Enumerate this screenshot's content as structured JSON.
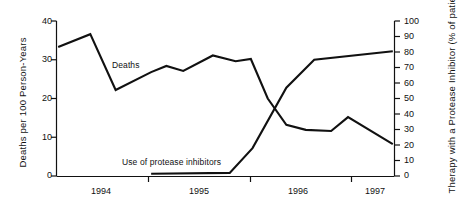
{
  "chart_data": {
    "type": "line",
    "title": "",
    "xlabel": "",
    "ylabel": "Deaths per 100 Person-Years",
    "y2label": "Therapy with a Protease Inhibitor (% of patient-days)",
    "grid": false,
    "legend_position": "inline-annotations",
    "xlim": [
      1993.5,
      1997.5
    ],
    "ylim": [
      0,
      40
    ],
    "y2lim": [
      0,
      100
    ],
    "xticks": [
      1994.0,
      1995.0,
      1996.0,
      1997.0
    ],
    "xtick_labels": [
      "1994",
      "1995",
      "1996",
      "1997"
    ],
    "xtick_label_positions": [
      1993.75,
      1994.75,
      1995.7,
      1996.45
    ],
    "yticks": [
      0,
      10,
      20,
      30,
      40
    ],
    "ytick_labels": [
      "0",
      "10",
      "20",
      "30",
      "40"
    ],
    "y2ticks": [
      0,
      10,
      20,
      30,
      40,
      50,
      60,
      70,
      80,
      90,
      100
    ],
    "y2tick_labels": [
      "0",
      "10",
      "20",
      "30",
      "40",
      "50",
      "60",
      "70",
      "80",
      "90",
      "100"
    ],
    "series": [
      {
        "name": "Deaths",
        "axis": "left",
        "annotation": "Deaths",
        "x": [
          1993.52,
          1993.9,
          1994.2,
          1994.62,
          1994.8,
          1995.0,
          1995.35,
          1995.62,
          1995.8,
          1996.0,
          1996.22,
          1996.45,
          1996.75,
          1996.95,
          1997.48
        ],
        "values": [
          33.3,
          36.6,
          22.2,
          26.8,
          28.4,
          27.1,
          31.1,
          29.6,
          30.2,
          20.0,
          13.2,
          11.9,
          11.6,
          15.2,
          8.2
        ]
      },
      {
        "name": "Use of protease inhibitors",
        "axis": "right",
        "annotation": "Use of protease inhibitors",
        "x": [
          1994.62,
          1995.55,
          1995.82,
          1996.22,
          1996.55,
          1997.48
        ],
        "values": [
          1.5,
          2.0,
          18.0,
          57.0,
          75.0,
          80.5
        ]
      }
    ]
  },
  "annotations": {
    "deaths": "Deaths",
    "protease": "Use of protease inhibitors"
  }
}
